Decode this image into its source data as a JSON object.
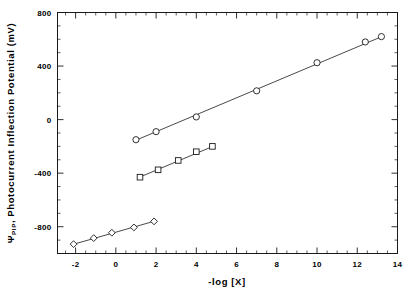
{
  "chart_data": {
    "type": "scatter",
    "title": "",
    "xlabel": "-log [X]",
    "ylabel": "ΨPIP, Photocurrent Inflection Potential (mV)",
    "ylabel_symbol": "Ψ",
    "ylabel_subscript": "PIP",
    "ylabel_rest": ", Photocurrent Inflection Potential (mV)",
    "xlim": [
      -2.9,
      14.0
    ],
    "ylim": [
      -1000,
      800
    ],
    "xticks": [
      -2,
      0,
      2,
      4,
      6,
      8,
      10,
      12,
      14
    ],
    "xtick_labels": [
      "-2",
      "0",
      "2",
      "4",
      "6",
      "8",
      "10",
      "12",
      "14"
    ],
    "yticks": [
      -800,
      -400,
      0,
      400,
      800
    ],
    "ytick_labels": [
      "-800",
      "-400",
      "0",
      "400",
      "800"
    ],
    "x_minor_step": 0.5,
    "y_minor_step": 100,
    "grid": false,
    "legend": "none",
    "series": [
      {
        "name": "upper-series",
        "marker": "circle",
        "points": [
          {
            "x": 1.0,
            "y": -150
          },
          {
            "x": 2.0,
            "y": -90
          },
          {
            "x": 4.0,
            "y": 20
          },
          {
            "x": 7.0,
            "y": 215
          },
          {
            "x": 10.0,
            "y": 425
          },
          {
            "x": 12.4,
            "y": 580
          },
          {
            "x": 13.2,
            "y": 620
          }
        ],
        "fit_line": {
          "x1": 0.9,
          "y1": -160,
          "x2": 13.3,
          "y2": 625
        }
      },
      {
        "name": "middle-series",
        "marker": "square",
        "points": [
          {
            "x": 1.2,
            "y": -430
          },
          {
            "x": 2.1,
            "y": -375
          },
          {
            "x": 3.1,
            "y": -305
          },
          {
            "x": 4.0,
            "y": -240
          },
          {
            "x": 4.8,
            "y": -200
          }
        ],
        "fit_line": {
          "x1": 1.1,
          "y1": -435,
          "x2": 4.9,
          "y2": -195
        }
      },
      {
        "name": "lower-series",
        "marker": "diamond",
        "points": [
          {
            "x": -2.1,
            "y": -930
          },
          {
            "x": -1.1,
            "y": -885
          },
          {
            "x": -0.2,
            "y": -845
          },
          {
            "x": 0.9,
            "y": -805
          },
          {
            "x": 1.9,
            "y": -760
          }
        ],
        "fit_line": {
          "x1": -2.2,
          "y1": -935,
          "x2": 2.0,
          "y2": -755
        }
      }
    ]
  },
  "axes": {
    "x_title": "-log [X]",
    "y_title_symbol": "Ψ",
    "y_title_sub": "PIP",
    "y_title_text": ", Photocurrent Inflection Potential (mV)"
  }
}
